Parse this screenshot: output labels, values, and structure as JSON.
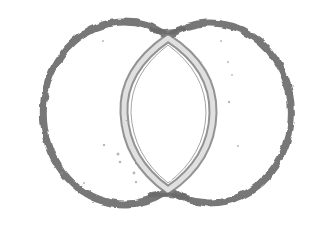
{
  "diagram": {
    "type": "venn",
    "style": "hand-drawn sketch",
    "sets": [
      {
        "id": "left-circle",
        "label": "",
        "cx": 100,
        "cy": 113,
        "rx": 81,
        "ry": 91
      },
      {
        "id": "right-circle",
        "label": "",
        "cx": 236,
        "cy": 113,
        "rx": 81,
        "ry": 90
      }
    ],
    "intersection": {
      "label": "",
      "highlighted": true
    },
    "colors": {
      "background": "#ffffff",
      "circle_stroke": "#6b6b6b",
      "lens_outer": "#7a7a7a",
      "lens_fill_band": "#d9d9d9",
      "speckle": "#9a9a9a"
    }
  }
}
